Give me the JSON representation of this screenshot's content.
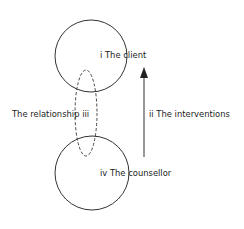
{
  "diagram": {
    "nodes": [
      {
        "id": "client",
        "label": "i The client",
        "shape": "circle",
        "cx": 91,
        "cy": 56,
        "r": 36
      },
      {
        "id": "counsellor",
        "label": "iv The counsellor",
        "shape": "circle",
        "cx": 92,
        "cy": 173,
        "r": 37
      }
    ],
    "relationship": {
      "label": "The relationship iii",
      "shape": "dashed-ellipse",
      "cx": 86,
      "cy": 113,
      "rx": 11,
      "ry": 43
    },
    "interventions": {
      "label": "ii The interventions",
      "direction": "up",
      "x": 144,
      "y_start": 157,
      "y_end": 68
    },
    "colors": {
      "stroke": "#333333",
      "text": "#222222",
      "background": "#ffffff"
    }
  }
}
